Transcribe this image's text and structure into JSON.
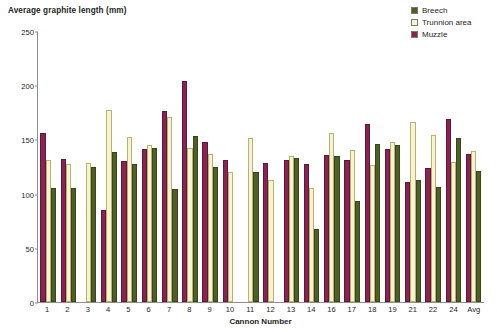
{
  "chart_data": {
    "type": "bar",
    "title": "Average graphite length (mm)",
    "xlabel": "Cannon Number",
    "ylabel": "",
    "ylim": [
      0,
      250
    ],
    "yticks": [
      0,
      50,
      100,
      150,
      200,
      250
    ],
    "grid": false,
    "legend_position": "top-right",
    "bar_order_in_group": [
      "Muzzle",
      "Trunnion area",
      "Breech"
    ],
    "categories": [
      "1",
      "2",
      "3",
      "4",
      "5",
      "6",
      "7",
      "8",
      "9",
      "10",
      "11",
      "12",
      "13",
      "14",
      "16",
      "17",
      "18",
      "19",
      "21",
      "22",
      "24",
      "Avg"
    ],
    "series": [
      {
        "name": "Breech",
        "color": "#4d6127",
        "values": [
          105,
          105,
          125,
          138,
          127,
          142,
          104,
          153,
          125,
          null,
          120,
          null,
          133,
          67,
          135,
          93,
          146,
          145,
          113,
          106,
          151,
          121
        ]
      },
      {
        "name": "Trunnion area",
        "color": "#f7f3d2",
        "values": [
          131,
          127,
          128,
          177,
          152,
          145,
          171,
          142,
          137,
          120,
          151,
          113,
          135,
          105,
          156,
          140,
          126,
          148,
          166,
          154,
          129,
          139
        ]
      },
      {
        "name": "Muzzle",
        "color": "#8a2252",
        "values": [
          156,
          132,
          null,
          85,
          130,
          141,
          176,
          204,
          148,
          131,
          null,
          128,
          131,
          127,
          136,
          131,
          164,
          141,
          111,
          124,
          169,
          137
        ]
      }
    ],
    "legend": [
      {
        "label": "Breech",
        "color": "#4d6127"
      },
      {
        "label": "Trunnion area",
        "color": "#f7f3d2"
      },
      {
        "label": "Muzzle",
        "color": "#8a2252"
      }
    ]
  }
}
